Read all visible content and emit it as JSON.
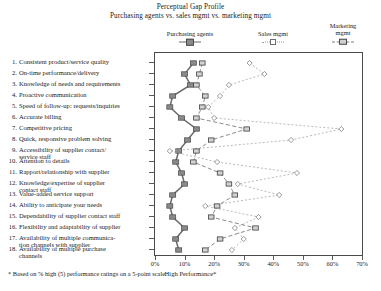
{
  "title": {
    "line1": "Perceptual Gap Profile",
    "line2": "Purchasing agents vs. sales mgmt vs. marketing mgmt"
  },
  "legend": [
    {
      "label": "Purchasing agents",
      "marker": "filled-square",
      "color": "#8a8a8a",
      "line": "solid"
    },
    {
      "label": "Sales mgmt",
      "marker": "open-diamond",
      "color": "#ffffff",
      "line": "dotted"
    },
    {
      "label": "Marketing\nmgmt",
      "marker": "half-square",
      "color": "#cfcfcf",
      "line": "dashed"
    }
  ],
  "footnote": "* Based on % high (5) performance ratings on a 5-point scale",
  "xaxis_title": "High Performance*",
  "chart_data": {
    "type": "line",
    "title": "Perceptual Gap Profile",
    "subtitle": "Purchasing agents vs. sales mgmt vs. marketing mgmt",
    "orientation": "horizontal",
    "xlabel": "High Performance*",
    "ylabel": "",
    "xlim": [
      0,
      70
    ],
    "xticks": [
      0,
      10,
      20,
      30,
      40,
      50,
      60,
      70
    ],
    "xticklabels": [
      "0%",
      "10%",
      "20%",
      "30%",
      "40%",
      "50%",
      "60%",
      "70%"
    ],
    "grid": false,
    "legend_position": "top",
    "categories": [
      "Consistent product/service quality",
      "On-time performance/delivery",
      "Knowledge of needs and requirements",
      "Proactive communication",
      "Speed of follow-up: requests/inquiries",
      "Accurate billing",
      "Competitive pricing",
      "Quick, responsive problem solving",
      "Accessibility of supplier contact/ service staff",
      "Attention to details",
      "Rapport/relationship with supplier",
      "Knowledge/expertise of supplier contact staff",
      "Value-added service support",
      "Ability to anticipate your needs",
      "Dependability of supplier contact staff",
      "Flexibility and adaptability of supplier",
      "Availability of multiple communication channels with supplier",
      "Availability of multiple purchase channels"
    ],
    "category_lines": [
      [
        "Consistent product/service quality"
      ],
      [
        "On-time performance/delivery"
      ],
      [
        "Knowledge of needs and requirements"
      ],
      [
        "Proactive communication"
      ],
      [
        "Speed of follow-up: requests/inquiries"
      ],
      [
        "Accurate billing"
      ],
      [
        "Competitive pricing"
      ],
      [
        "Quick, responsive problem solving"
      ],
      [
        "Accessibility of supplier contact/",
        "service staff"
      ],
      [
        "Attention to details"
      ],
      [
        "Rapport/relationship with supplier"
      ],
      [
        "Knowledge/expertise of supplier",
        "contact staff"
      ],
      [
        "Value-added service support"
      ],
      [
        "Ability to anticipate your needs"
      ],
      [
        "Dependability of supplier contact staff"
      ],
      [
        "Flexibility and adaptability of supplier"
      ],
      [
        "Availability of multiple communica-",
        "tion channels with supplier"
      ],
      [
        "Availability of multiple purchase",
        "channels"
      ]
    ],
    "series": [
      {
        "name": "Purchasing agents",
        "marker": "filled-square",
        "line": "solid",
        "values": [
          13,
          10,
          12,
          6,
          5,
          9,
          14,
          11,
          8,
          7,
          9,
          10,
          6,
          5,
          6,
          10,
          7,
          8
        ]
      },
      {
        "name": "Sales mgmt",
        "marker": "open-diamond",
        "line": "dotted",
        "values": [
          32,
          37,
          25,
          22,
          18,
          20,
          63,
          46,
          5,
          21,
          48,
          28,
          42,
          17,
          35,
          27,
          30,
          26
        ]
      },
      {
        "name": "Marketing mgmt",
        "marker": "half-square",
        "line": "dashed",
        "values": [
          16,
          15,
          14,
          17,
          16,
          14,
          31,
          19,
          14,
          13,
          22,
          25,
          27,
          21,
          19,
          34,
          22,
          17
        ]
      }
    ]
  }
}
